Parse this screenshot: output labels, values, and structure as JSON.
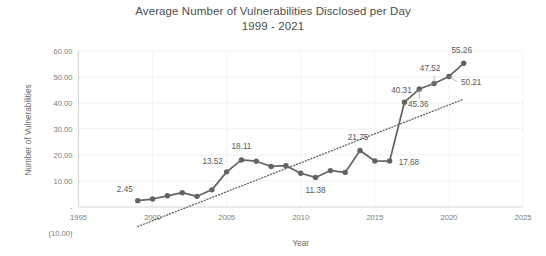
{
  "chart_data": {
    "type": "line",
    "title": "Average Number of Vulnerabilities Disclosed per Day",
    "subtitle": "1999 - 2021",
    "xlabel": "Year",
    "ylabel": "Number of Vulnerabilities",
    "xlim": [
      1995,
      2025
    ],
    "ylim": [
      -10,
      60
    ],
    "grid": true,
    "legend": "none",
    "x_ticks": [
      "1995",
      "2000",
      "2005",
      "2010",
      "2015",
      "2020",
      "2025"
    ],
    "y_ticks": [
      "60.00",
      "50.00",
      "40.00",
      "30.00",
      "20.00",
      "10.00",
      "-",
      "(10.00)"
    ],
    "x": [
      1999,
      2000,
      2001,
      2002,
      2003,
      2004,
      2005,
      2006,
      2007,
      2008,
      2009,
      2010,
      2011,
      2012,
      2013,
      2014,
      2015,
      2016,
      2017,
      2018,
      2019,
      2020,
      2021
    ],
    "values": [
      2.45,
      3.06,
      4.3,
      5.5,
      4.1,
      6.6,
      13.52,
      18.11,
      17.6,
      15.6,
      15.9,
      13.0,
      11.38,
      14.0,
      13.3,
      21.75,
      17.7,
      17.68,
      40.31,
      45.36,
      47.52,
      50.21,
      55.26
    ],
    "point_labels": [
      {
        "x": 1999,
        "value": 2.45,
        "text": "2.45"
      },
      {
        "x": 2005,
        "value": 13.52,
        "text": "13.52"
      },
      {
        "x": 2006,
        "value": 18.11,
        "text": "18.11"
      },
      {
        "x": 2011,
        "value": 11.38,
        "text": "11.38"
      },
      {
        "x": 2014,
        "value": 21.75,
        "text": "21.75"
      },
      {
        "x": 2016,
        "value": 17.68,
        "text": "17.68"
      },
      {
        "x": 2017,
        "value": 40.31,
        "text": "40.31"
      },
      {
        "x": 2018,
        "value": 45.36,
        "text": "45.36"
      },
      {
        "x": 2019,
        "value": 47.52,
        "text": "47.52"
      },
      {
        "x": 2020,
        "value": 50.21,
        "text": "50.21"
      },
      {
        "x": 2021,
        "value": 55.26,
        "text": "55.26"
      }
    ],
    "trendline": {
      "type": "linear",
      "x_start": 1999,
      "y_start": -7.5,
      "x_end": 2021,
      "y_end": 41.5,
      "style": "dotted"
    },
    "series_color": "#636363",
    "trendline_color": "#5f5f5f",
    "grid_color": "#e6e6e6",
    "background": "#ffffff"
  }
}
